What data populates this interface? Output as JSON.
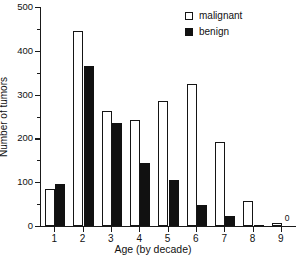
{
  "chart_data": {
    "type": "bar",
    "title": "",
    "subtitle": "",
    "xlabel": "Age (by decade)",
    "ylabel": "Number of tumors",
    "categories": [
      "1",
      "2",
      "3",
      "4",
      "5",
      "6",
      "7",
      "8",
      "9"
    ],
    "series": [
      {
        "name": "malignant",
        "color": "#ffffff",
        "edgecolor": "#151515",
        "values": [
          85,
          445,
          262,
          243,
          285,
          325,
          192,
          58,
          7
        ]
      },
      {
        "name": "benign",
        "color": "#111111",
        "edgecolor": "#111111",
        "values": [
          97,
          365,
          235,
          145,
          104,
          48,
          23,
          3,
          0
        ]
      }
    ],
    "ylim": [
      0,
      500
    ],
    "yticks": [
      0,
      100,
      200,
      300,
      400,
      500
    ],
    "ytick_labels": [
      "0",
      "100",
      "200",
      "300",
      "400",
      "500"
    ],
    "yminor_ticks": [
      50,
      150,
      250,
      350,
      450
    ],
    "grid": false,
    "legend_position": "top-right",
    "annotations": [
      {
        "text": "0",
        "category": "9",
        "series": "benign",
        "value": 0
      }
    ]
  },
  "legend": {
    "entries": [
      {
        "label": "malignant",
        "swatch": "open-square"
      },
      {
        "label": "benign",
        "swatch": "filled-square"
      }
    ]
  },
  "axes": {
    "y": {
      "label": "Number of tumors",
      "ticks": [
        "0",
        "100",
        "200",
        "300",
        "400",
        "500"
      ]
    },
    "x": {
      "label": "Age (by decade)",
      "ticks": [
        "1",
        "2",
        "3",
        "4",
        "5",
        "6",
        "7",
        "8",
        "9"
      ]
    }
  },
  "colors": {
    "axis": "#1a1a1a",
    "malignant": "#ffffff",
    "benign": "#111111",
    "background": "#ffffff"
  }
}
